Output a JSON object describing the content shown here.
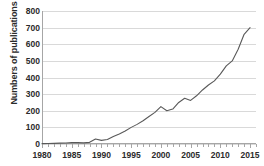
{
  "chart_data": {
    "type": "line",
    "title": "",
    "xlabel": "",
    "ylabel": "Numbers of publications",
    "xlim": [
      1980,
      2016
    ],
    "ylim": [
      0,
      800
    ],
    "grid": true,
    "legend": false,
    "y_ticks": [
      0,
      100,
      200,
      300,
      400,
      500,
      600,
      700,
      800
    ],
    "x_ticks": [
      1980,
      1985,
      1990,
      1995,
      2000,
      2005,
      2010,
      2015
    ],
    "x_minor_tick_step": 1,
    "line_color": "#595959",
    "grid_color": "#d9d9d9",
    "axis_color": "#a6a6a6",
    "series": [
      {
        "name": "Numbers of publications",
        "x": [
          1980,
          1981,
          1982,
          1983,
          1984,
          1985,
          1986,
          1987,
          1988,
          1989,
          1990,
          1991,
          1992,
          1993,
          1994,
          1995,
          1996,
          1997,
          1998,
          1999,
          2000,
          2001,
          2002,
          2003,
          2004,
          2005,
          2006,
          2007,
          2008,
          2009,
          2010,
          2011,
          2012,
          2013,
          2014,
          2015
        ],
        "values": [
          2,
          3,
          4,
          5,
          6,
          8,
          8,
          7,
          10,
          30,
          22,
          27,
          45,
          60,
          78,
          100,
          118,
          140,
          165,
          190,
          225,
          200,
          210,
          250,
          275,
          262,
          290,
          325,
          355,
          380,
          420,
          470,
          500,
          570,
          660,
          700
        ]
      }
    ]
  }
}
